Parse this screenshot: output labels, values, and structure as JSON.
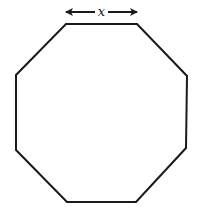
{
  "diagram": {
    "shape": "regular octagon",
    "side_label": "x",
    "annotation": "double-headed arrow above top side indicating side length",
    "colors": {
      "stroke": "#1a1a1a",
      "background": "#ffffff"
    },
    "vertices": [
      [
        66,
        24
      ],
      [
        137,
        24
      ],
      [
        187,
        76
      ],
      [
        186,
        148
      ],
      [
        136,
        202
      ],
      [
        67,
        202
      ],
      [
        16,
        150
      ],
      [
        16,
        75
      ]
    ]
  }
}
